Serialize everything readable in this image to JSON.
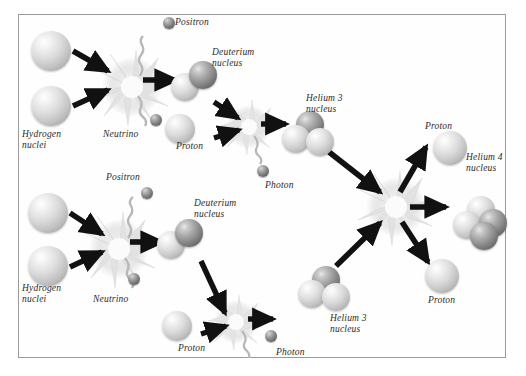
{
  "diagram": {
    "background_color": "#ffffff",
    "border_color": "#9a9a9a",
    "labels": [
      {
        "id": "positron-top",
        "text": "Positron",
        "x": 175,
        "y": 17
      },
      {
        "id": "deuterium-top",
        "text": "Deuterium\nnucleus",
        "x": 212,
        "y": 47
      },
      {
        "id": "hydrogen-top",
        "text": "Hydrogen\nnuclei",
        "x": 22,
        "y": 129
      },
      {
        "id": "neutrino-top",
        "text": "Neutrino",
        "x": 103,
        "y": 129
      },
      {
        "id": "helium3-top",
        "text": "Helium 3\nnucleus",
        "x": 306,
        "y": 93
      },
      {
        "id": "proton-top-left",
        "text": "Proton",
        "x": 176,
        "y": 141
      },
      {
        "id": "photon-top",
        "text": "Photon",
        "x": 265,
        "y": 180
      },
      {
        "id": "proton-upper-right",
        "text": "Proton",
        "x": 425,
        "y": 121
      },
      {
        "id": "helium4",
        "text": "Helium 4\nnucleus",
        "x": 466,
        "y": 152
      },
      {
        "id": "positron-mid",
        "text": "Positron",
        "x": 106,
        "y": 172
      },
      {
        "id": "deuterium-bottom",
        "text": "Deuterium\nnucleus",
        "x": 194,
        "y": 198
      },
      {
        "id": "hydrogen-bottom",
        "text": "Hydrogen\nnuclei",
        "x": 22,
        "y": 283
      },
      {
        "id": "neutrino-bottom",
        "text": "Neutrino",
        "x": 93,
        "y": 294
      },
      {
        "id": "proton-bottom-left",
        "text": "Proton",
        "x": 178,
        "y": 343
      },
      {
        "id": "photon-bottom",
        "text": "Photon",
        "x": 276,
        "y": 347
      },
      {
        "id": "helium3-bottom",
        "text": "Helium 3\nnucleus",
        "x": 330,
        "y": 313
      },
      {
        "id": "proton-lower-right",
        "text": "Proton",
        "x": 428,
        "y": 295
      }
    ],
    "particles": [
      {
        "id": "hydrogen-1",
        "kind": "proton",
        "x": 30,
        "y": 30,
        "size": 38
      },
      {
        "id": "hydrogen-2",
        "kind": "proton",
        "x": 30,
        "y": 85,
        "size": 38
      },
      {
        "id": "positron-1",
        "kind": "positron",
        "x": 163,
        "y": 16,
        "size": 11
      },
      {
        "id": "neutrino-1",
        "kind": "neutrino",
        "x": 150,
        "y": 113,
        "size": 11
      },
      {
        "id": "deuterium-1",
        "kind": "deuterium",
        "x": 170,
        "y": 60,
        "size": 26
      },
      {
        "id": "proton-a",
        "kind": "proton",
        "x": 164,
        "y": 113,
        "size": 28
      },
      {
        "id": "photon-1",
        "kind": "photon",
        "x": 256,
        "y": 164,
        "size": 11
      },
      {
        "id": "helium3-1",
        "kind": "helium3",
        "x": 281,
        "y": 113,
        "size": 27
      },
      {
        "id": "hydrogen-3",
        "kind": "proton",
        "x": 27,
        "y": 192,
        "size": 38
      },
      {
        "id": "hydrogen-4",
        "kind": "proton",
        "x": 27,
        "y": 245,
        "size": 38
      },
      {
        "id": "positron-2",
        "kind": "positron",
        "x": 141,
        "y": 186,
        "size": 11
      },
      {
        "id": "neutrino-2",
        "kind": "neutrino",
        "x": 128,
        "y": 272,
        "size": 11
      },
      {
        "id": "deuterium-2",
        "kind": "deuterium",
        "x": 156,
        "y": 218,
        "size": 26
      },
      {
        "id": "proton-b",
        "kind": "proton",
        "x": 161,
        "y": 310,
        "size": 28
      },
      {
        "id": "photon-2",
        "kind": "photon",
        "x": 264,
        "y": 329,
        "size": 11
      },
      {
        "id": "helium3-2",
        "kind": "helium3",
        "x": 297,
        "y": 268,
        "size": 27
      },
      {
        "id": "proton-out-1",
        "kind": "proton",
        "x": 432,
        "y": 130,
        "size": 32
      },
      {
        "id": "proton-out-2",
        "kind": "proton",
        "x": 424,
        "y": 258,
        "size": 32
      },
      {
        "id": "helium4-1",
        "kind": "helium4",
        "x": 452,
        "y": 195,
        "size": 28
      }
    ],
    "bursts": [
      {
        "id": "burst-top-left",
        "x": 132,
        "y": 85,
        "r": 34
      },
      {
        "id": "burst-top-right",
        "x": 249,
        "y": 125,
        "r": 26
      },
      {
        "id": "burst-bottom-left",
        "x": 119,
        "y": 247,
        "r": 34
      },
      {
        "id": "burst-bottom-right",
        "x": 236,
        "y": 320,
        "r": 26
      },
      {
        "id": "burst-center",
        "x": 396,
        "y": 205,
        "r": 34
      }
    ]
  }
}
